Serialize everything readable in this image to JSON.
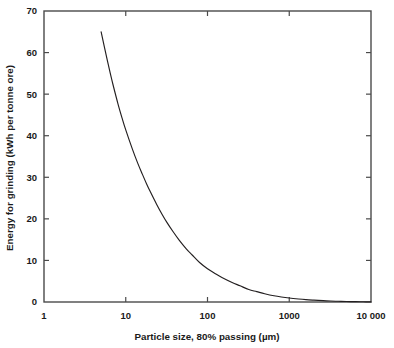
{
  "chart_data": {
    "type": "line",
    "title": "",
    "xlabel": "Particle size, 80% passing (µm)",
    "ylabel": "Energy for grinding (kWh per tonne ore)",
    "xscale": "log",
    "yscale": "linear",
    "xlim": [
      1,
      10000
    ],
    "ylim": [
      0,
      70
    ],
    "grid": false,
    "legend": null,
    "xticks": [
      1,
      10,
      100,
      1000,
      10000
    ],
    "xticklabels": [
      "1",
      "10",
      "100",
      "1000",
      "10 000"
    ],
    "yticks": [
      0,
      10,
      20,
      30,
      40,
      50,
      60,
      70
    ],
    "yticklabels": [
      "0",
      "10",
      "20",
      "30",
      "40",
      "50",
      "60",
      "70"
    ],
    "series": [
      {
        "name": "Energy for grinding",
        "color": "#231f20",
        "x": [
          5,
          5.5,
          6,
          6.5,
          7,
          8,
          9,
          10,
          12,
          14,
          16,
          18,
          20,
          24,
          28,
          32,
          38,
          45,
          55,
          65,
          80,
          100,
          125,
          150,
          200,
          250,
          320,
          400,
          500,
          650,
          800,
          1000,
          1300,
          1600,
          2000,
          2600,
          3200,
          4000,
          5000,
          6500,
          8000,
          10000
        ],
        "y": [
          65.0,
          61.2,
          57.8,
          54.8,
          52.2,
          47.8,
          44.3,
          41.4,
          36.9,
          33.4,
          30.7,
          28.4,
          26.5,
          23.4,
          21.0,
          19.1,
          16.9,
          14.9,
          12.8,
          11.3,
          9.5,
          8.0,
          6.8,
          5.9,
          4.7,
          3.9,
          3.0,
          2.5,
          2.0,
          1.5,
          1.2,
          0.95,
          0.72,
          0.57,
          0.45,
          0.32,
          0.24,
          0.17,
          0.12,
          0.08,
          0.05,
          0.03
        ]
      }
    ],
    "annotations": []
  },
  "axes": {
    "x_title": "Particle size, 80% passing (µm)",
    "y_title": "Energy for grinding (kWh per tonne ore)",
    "x_tick_labels": [
      "1",
      "10",
      "100",
      "1000",
      "10 000"
    ],
    "y_tick_labels": [
      "70",
      "60",
      "50",
      "40",
      "30",
      "20",
      "10",
      "0"
    ]
  },
  "style": {
    "frame_color": "#4a4a4a",
    "curve_color": "#231f20",
    "text_color": "#1a1a1a",
    "background": "#ffffff"
  }
}
